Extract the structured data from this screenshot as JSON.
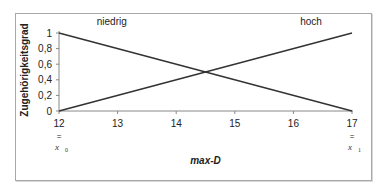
{
  "chart_data": {
    "type": "line",
    "title": "",
    "xlabel": "max-D",
    "ylabel": "Zugehörigkeitsgrad",
    "x_ticks": [
      "12",
      "13",
      "14",
      "15",
      "16",
      "17"
    ],
    "y_ticks": [
      "0",
      "0,2",
      "0,4",
      "0,6",
      "0,8",
      "1"
    ],
    "xlim": [
      12,
      17
    ],
    "ylim": [
      0,
      1
    ],
    "grid": false,
    "legend": "none",
    "x_sublabels": [
      {
        "at": "12",
        "eq": "=",
        "label": "x",
        "sub": "0"
      },
      {
        "at": "17",
        "eq": "=",
        "label": "x",
        "sub": "1"
      }
    ],
    "series": [
      {
        "name": "niedrig",
        "x": [
          12,
          17
        ],
        "values": [
          1,
          0
        ]
      },
      {
        "name": "hoch",
        "x": [
          12,
          17
        ],
        "values": [
          0,
          1
        ]
      }
    ],
    "annotations": [
      {
        "text": "niedrig",
        "x": 12.9,
        "y": 1.05
      },
      {
        "text": "hoch",
        "x": 16.3,
        "y": 1.05
      }
    ],
    "line_color": "#333333"
  }
}
